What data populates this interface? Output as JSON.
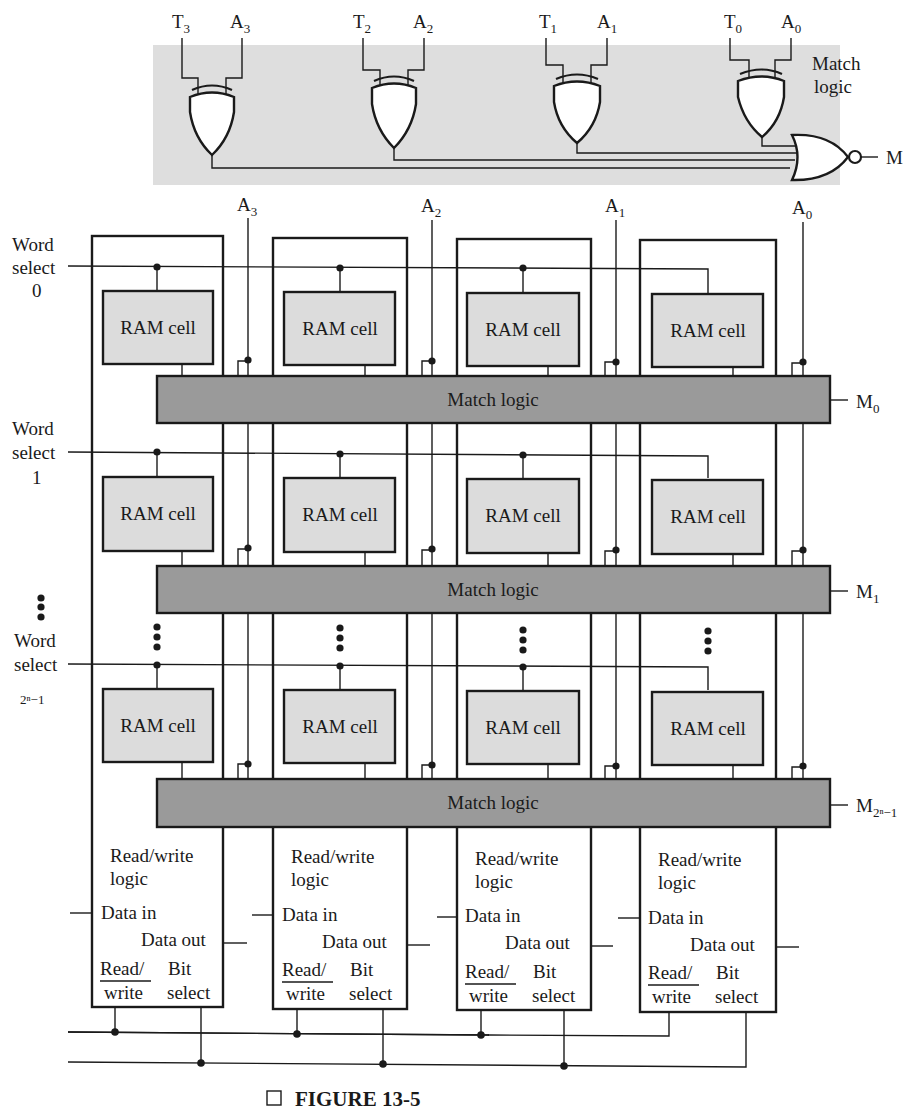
{
  "figure": {
    "caption": "FIGURE 13-5",
    "caption_marker": "□"
  },
  "colors": {
    "match_logic_fill": "#9a9a9a",
    "ram_cell_fill": "#dcdcdc",
    "match_panel_bg": "#dedede",
    "line": "#1a1a1a"
  },
  "match_logic_detail": {
    "title_line1": "Match",
    "title_line2": "logic",
    "output_label": "M",
    "xor_inputs": [
      {
        "t_main": "T",
        "t_sub": "3",
        "a_main": "A",
        "a_sub": "3"
      },
      {
        "t_main": "T",
        "t_sub": "2",
        "a_main": "A",
        "a_sub": "2"
      },
      {
        "t_main": "T",
        "t_sub": "1",
        "a_main": "A",
        "a_sub": "1"
      },
      {
        "t_main": "T",
        "t_sub": "0",
        "a_main": "A",
        "a_sub": "0"
      }
    ],
    "gate_types": [
      "XOR",
      "XOR",
      "XOR",
      "XOR",
      "NOR"
    ]
  },
  "array": {
    "address_lines": [
      {
        "main": "A",
        "sub": "3"
      },
      {
        "main": "A",
        "sub": "2"
      },
      {
        "main": "A",
        "sub": "1"
      },
      {
        "main": "A",
        "sub": "0"
      }
    ],
    "word_selects": [
      {
        "line1": "Word",
        "line2": "select",
        "line3": "0"
      },
      {
        "line1": "Word",
        "line2": "select",
        "line3": "1"
      },
      {
        "line1": "Word",
        "line2": "select",
        "line3": "2ⁿ−1"
      }
    ],
    "cell_label": "RAM cell",
    "match_bar_label": "Match logic",
    "match_outputs": [
      {
        "main": "M",
        "sub": "0"
      },
      {
        "main": "M",
        "sub": "1"
      },
      {
        "main": "M",
        "sub": "2ⁿ−1"
      }
    ],
    "rw_block": {
      "title_line1": "Read/write",
      "title_line2": "logic",
      "data_in": "Data in",
      "data_out": "Data out",
      "read_write_top": "Read/",
      "read_write_bottom": "write",
      "bit_select_top": "Bit",
      "bit_select_bottom": "select"
    }
  }
}
